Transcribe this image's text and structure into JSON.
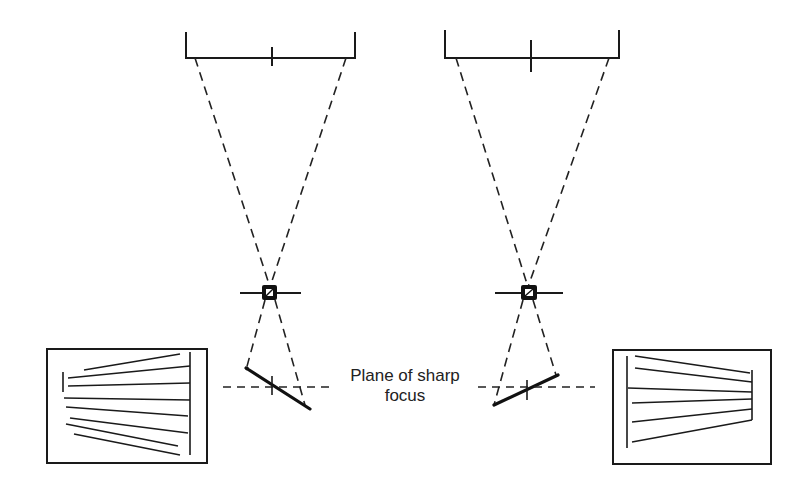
{
  "diagram": {
    "labels": {
      "plane_of_focus_line1": "Plane of sharp",
      "plane_of_focus_line2": "focus"
    },
    "elements": {
      "left_subject_bracket": "subject plane (left setup)",
      "right_subject_bracket": "subject plane (right setup)",
      "left_lens": "lens (left)",
      "right_lens": "lens (right)",
      "left_film_plane": "tilted film plane (left)",
      "right_film_plane": "tilted film plane (right)",
      "left_result_image": "resulting image (left)",
      "right_result_image": "resulting image (right)"
    },
    "colors": {
      "ink": "#1a1a1a",
      "background": "#ffffff"
    }
  }
}
